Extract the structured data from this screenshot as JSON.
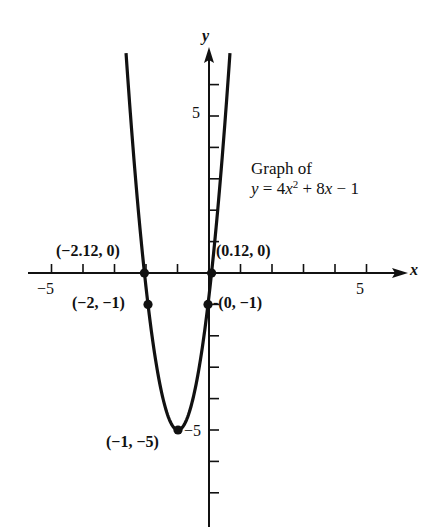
{
  "chart_data": {
    "type": "line",
    "equation": {
      "a": 4,
      "b": 8,
      "c": -1
    },
    "xlabel": "x",
    "ylabel": "y",
    "xlim": [
      -5.5,
      6.2
    ],
    "ylim": [
      -8,
      7.5
    ],
    "x_ticks": [
      -5,
      -4,
      -3,
      -2,
      -1,
      1,
      2,
      3,
      4,
      5
    ],
    "y_ticks": [
      -7,
      -6,
      -5,
      -4,
      -3,
      -2,
      -1,
      1,
      2,
      3,
      4,
      5,
      6
    ],
    "tick_labels": {
      "x_min": "−5",
      "x_max": "5",
      "y_max": "5",
      "y_min": "−5"
    },
    "grid": false,
    "legend": null,
    "series": [
      {
        "name": "y = 4x^2 + 8x - 1",
        "x": [
          -2.66,
          -2.5,
          -2.12,
          -2,
          -1.5,
          -1,
          -0.5,
          0,
          0.12,
          0.5,
          0.66
        ],
        "y": [
          7.0,
          4.0,
          0.0,
          -1.0,
          -4.0,
          -5.0,
          -4.0,
          -1.0,
          0.0,
          4.0,
          7.0
        ]
      }
    ],
    "points": [
      {
        "x": -2.12,
        "y": 0,
        "label": "(−2.12, 0)",
        "role": "x-intercept"
      },
      {
        "x": 0.12,
        "y": 0,
        "label": "(0.12, 0)",
        "role": "x-intercept"
      },
      {
        "x": -2,
        "y": -1,
        "label": "(−2, −1)",
        "role": "symmetric point"
      },
      {
        "x": 0,
        "y": -1,
        "label": "-(0, −1)",
        "role": "y-intercept"
      },
      {
        "x": -1,
        "y": -5,
        "label": "(−1, −5)",
        "role": "vertex"
      }
    ],
    "annotation": {
      "line1": "Graph of",
      "line2_prefix": "y = 4",
      "line2_var": "x",
      "line2_exp": "2",
      "line2_mid": " + 8",
      "line2_var2": "x",
      "line2_suffix": " − 1"
    }
  },
  "colors": {
    "ink": "#111111",
    "background": "#ffffff"
  }
}
